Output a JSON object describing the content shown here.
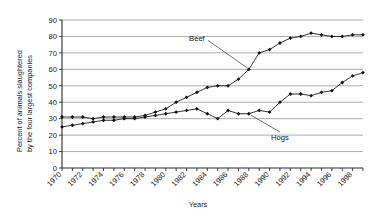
{
  "chart_data": {
    "type": "line",
    "title": "",
    "xlabel": "Years",
    "ylabel": "Percent of animals slaughtered by the four largest companies",
    "ylabel_line1": "Percent of animals slaughtered",
    "ylabel_line2": "by the four largest companies",
    "xlim": [
      1970,
      1999
    ],
    "ylim": [
      0,
      90
    ],
    "ytick_step": 10,
    "yticks": [
      0,
      10,
      20,
      30,
      40,
      50,
      60,
      70,
      80,
      90
    ],
    "xticks": [
      1970,
      1971,
      1972,
      1973,
      1974,
      1975,
      1976,
      1977,
      1978,
      1979,
      1980,
      1981,
      1982,
      1983,
      1984,
      1985,
      1986,
      1987,
      1988,
      1989,
      1990,
      1991,
      1992,
      1993,
      1994,
      1995,
      1996,
      1997,
      1998,
      1999
    ],
    "xtick_labels": [
      "1970",
      "1972",
      "1974",
      "1976",
      "1978",
      "1980",
      "1982",
      "1984",
      "1986",
      "1988",
      "1990",
      "1992",
      "1994",
      "1996",
      "1998"
    ],
    "xtick_label_years": [
      1970,
      1972,
      1974,
      1976,
      1978,
      1980,
      1982,
      1984,
      1986,
      1988,
      1990,
      1992,
      1994,
      1996,
      1998
    ],
    "grid": true,
    "grid_axis": "y",
    "legend": "none",
    "annotations": [
      {
        "text": "Beef",
        "series": "Beef",
        "x": 1983,
        "y": 77
      },
      {
        "text": "Hogs",
        "series": "Hogs",
        "x": 1991,
        "y": 17
      }
    ],
    "x": [
      1970,
      1971,
      1972,
      1973,
      1974,
      1975,
      1976,
      1977,
      1978,
      1979,
      1980,
      1981,
      1982,
      1983,
      1984,
      1985,
      1986,
      1987,
      1988,
      1989,
      1990,
      1991,
      1992,
      1993,
      1994,
      1995,
      1996,
      1997,
      1998,
      1999
    ],
    "series": [
      {
        "name": "Beef",
        "color": "#111111",
        "marker": "diamond",
        "values": [
          31,
          31,
          31,
          30,
          31,
          31,
          31,
          31,
          32,
          34,
          36,
          40,
          43,
          46,
          49,
          50,
          50,
          54,
          60,
          70,
          72,
          76,
          79,
          80,
          82,
          81,
          80,
          80,
          81,
          81
        ]
      },
      {
        "name": "Hogs",
        "color": "#111111",
        "marker": "diamond",
        "values": [
          25,
          26,
          27,
          28,
          29,
          29,
          30,
          30,
          31,
          32,
          33,
          34,
          35,
          36,
          33,
          30,
          35,
          33,
          33,
          35,
          34,
          40,
          45,
          45,
          44,
          46,
          47,
          52,
          56,
          58
        ]
      }
    ]
  }
}
